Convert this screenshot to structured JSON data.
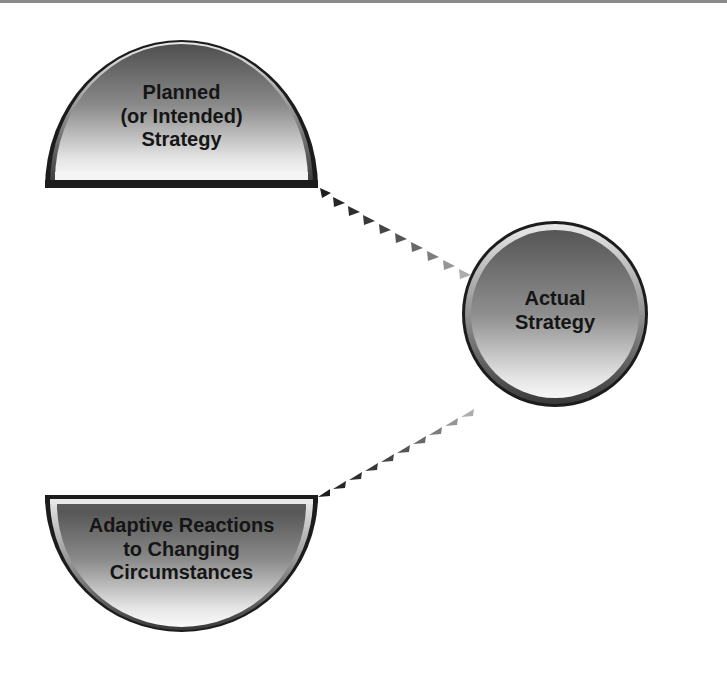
{
  "diagram": {
    "nodes": {
      "planned": {
        "shape": "half-circle-up",
        "lines": [
          "Planned",
          "(or Intended)",
          "Strategy"
        ]
      },
      "actual": {
        "shape": "circle",
        "lines": [
          "Actual",
          "Strategy"
        ]
      },
      "adaptive": {
        "shape": "half-circle-down",
        "lines": [
          "Adaptive Reactions",
          "to Changing",
          "Circumstances"
        ]
      }
    },
    "edges": [
      {
        "from": "planned",
        "to": "actual",
        "style": "dotted-triangle-arrow",
        "color_start": "#1a1a1a",
        "color_end": "#b0b0b0"
      },
      {
        "from": "adaptive",
        "to": "actual",
        "style": "dotted-triangle-arrow",
        "color_start": "#1a1a1a",
        "color_end": "#b0b0b0"
      }
    ],
    "colors": {
      "outline": "#1c1c1c",
      "fill_dark": "#5a5a5a",
      "fill_light": "#f2f2f2",
      "text": "#151515"
    }
  }
}
